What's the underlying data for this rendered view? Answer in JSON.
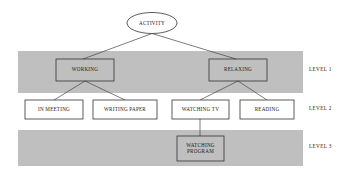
{
  "diagram": {
    "colors": {
      "band_fill": "#bfbfbf",
      "node_border": "#333333",
      "node_fill": "#ffffff",
      "connector": "#444444",
      "text": "#1a1a1a",
      "background": "#ffffff"
    },
    "root": {
      "id": "activity",
      "label": "ACTIVITY",
      "shape": "ellipse",
      "cx": 152,
      "cy": 23,
      "rx": 25,
      "ry": 10.5
    },
    "bands": [
      {
        "id": "band-level-1",
        "x": 18,
        "y": 51,
        "width": 285,
        "height": 42,
        "shaded": true
      },
      {
        "id": "band-level-3",
        "x": 18,
        "y": 130,
        "width": 285,
        "height": 36,
        "shaded": true
      }
    ],
    "level_labels": [
      {
        "id": "level-1",
        "label": "LEVEL 1",
        "x": 309,
        "y": 70
      },
      {
        "id": "level-2",
        "label": "LEVEL 2",
        "x": 309,
        "y": 109
      },
      {
        "id": "level-3",
        "label": "LEVEL 3",
        "x": 309,
        "y": 147
      }
    ],
    "nodes": [
      {
        "id": "working",
        "label": "WORKING",
        "level": 1,
        "shaded": true,
        "x": 56,
        "y": 59,
        "width": 58,
        "height": 22,
        "lines": [
          "WORKING"
        ]
      },
      {
        "id": "relaxing",
        "label": "RELAXING",
        "level": 1,
        "shaded": true,
        "x": 209,
        "y": 59,
        "width": 58,
        "height": 22,
        "lines": [
          "RELAXING"
        ]
      },
      {
        "id": "in-meeting",
        "label": "IN MEETING",
        "level": 2,
        "shaded": false,
        "x": 25,
        "y": 100,
        "width": 58,
        "height": 19,
        "lines": [
          "IN MEETING"
        ]
      },
      {
        "id": "writing-paper",
        "label": "WRITING PAPER",
        "level": 2,
        "shaded": false,
        "x": 93,
        "y": 100,
        "width": 64,
        "height": 19,
        "lines": [
          "WRITING PAPER"
        ]
      },
      {
        "id": "watching-tv",
        "label": "WATCHING TV",
        "level": 2,
        "shaded": false,
        "x": 172,
        "y": 100,
        "width": 57,
        "height": 19,
        "lines": [
          "WATCHING TV"
        ]
      },
      {
        "id": "reading",
        "label": "READING",
        "level": 2,
        "shaded": false,
        "x": 240,
        "y": 100,
        "width": 54,
        "height": 19,
        "lines": [
          "READING"
        ]
      },
      {
        "id": "watching-program",
        "label": "WATCHING PROGRAM",
        "level": 3,
        "shaded": true,
        "x": 177,
        "y": 136,
        "width": 47,
        "height": 25,
        "lines": [
          "WATCHING",
          "PROGRAM"
        ]
      }
    ],
    "edges": [
      {
        "id": "activity-working",
        "from": "activity",
        "to": "working",
        "x1": 152,
        "y1": 33.5,
        "x2": 83,
        "y2": 59
      },
      {
        "id": "activity-relaxing",
        "from": "activity",
        "to": "relaxing",
        "x1": 152,
        "y1": 33.5,
        "x2": 236,
        "y2": 59
      },
      {
        "id": "working-in-meeting",
        "from": "working",
        "to": "in-meeting",
        "x1": 85,
        "y1": 81,
        "x2": 54,
        "y2": 100
      },
      {
        "id": "working-writing-paper",
        "from": "working",
        "to": "writing-paper",
        "x1": 85,
        "y1": 81,
        "x2": 125,
        "y2": 100
      },
      {
        "id": "relaxing-watching-tv",
        "from": "relaxing",
        "to": "watching-tv",
        "x1": 238,
        "y1": 81,
        "x2": 200,
        "y2": 100
      },
      {
        "id": "relaxing-reading",
        "from": "relaxing",
        "to": "reading",
        "x1": 238,
        "y1": 81,
        "x2": 267,
        "y2": 100
      },
      {
        "id": "watching-tv-watching-program",
        "from": "watching-tv",
        "to": "watching-program",
        "x1": 200,
        "y1": 119,
        "x2": 200,
        "y2": 136
      }
    ]
  }
}
